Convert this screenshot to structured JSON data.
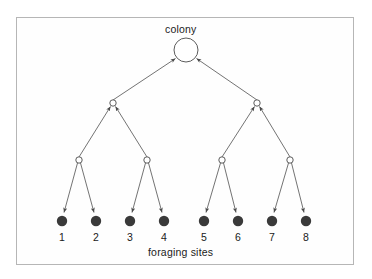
{
  "figure": {
    "title_top": "colony",
    "title_bottom": "foraging sites",
    "frame": {
      "x": 16,
      "y": 17,
      "width": 338,
      "height": 248,
      "border_color": "#b6b6b6"
    },
    "colors": {
      "edge": "#5a5a5a",
      "open_node_stroke": "#4a4a4a",
      "open_node_fill": "#ffffff",
      "leaf_fill": "#3a3a3a",
      "text": "#1a1a1a",
      "background": "#ffffff"
    }
  },
  "diagram": {
    "type": "tree",
    "nodes": [
      {
        "id": "colony",
        "label": "colony",
        "level": 0,
        "x": 186,
        "y": 50,
        "r": 12,
        "style": "open-circle"
      },
      {
        "id": "L1a",
        "label": "",
        "level": 1,
        "x": 113,
        "y": 103,
        "r": 3.2,
        "style": "open-circle"
      },
      {
        "id": "L1b",
        "label": "",
        "level": 1,
        "x": 257,
        "y": 103,
        "r": 3.2,
        "style": "open-circle"
      },
      {
        "id": "L2a",
        "label": "",
        "level": 2,
        "x": 79,
        "y": 160,
        "r": 3.2,
        "style": "open-circle"
      },
      {
        "id": "L2b",
        "label": "",
        "level": 2,
        "x": 147,
        "y": 160,
        "r": 3.2,
        "style": "open-circle"
      },
      {
        "id": "L2c",
        "label": "",
        "level": 2,
        "x": 222,
        "y": 160,
        "r": 3.2,
        "style": "open-circle"
      },
      {
        "id": "L2d",
        "label": "",
        "level": 2,
        "x": 290,
        "y": 160,
        "r": 3.2,
        "style": "open-circle"
      },
      {
        "id": "S1",
        "label": "1",
        "level": 3,
        "x": 62,
        "y": 221,
        "r": 5.2,
        "style": "filled-circle"
      },
      {
        "id": "S2",
        "label": "2",
        "level": 3,
        "x": 96,
        "y": 221,
        "r": 5.2,
        "style": "filled-circle"
      },
      {
        "id": "S3",
        "label": "3",
        "level": 3,
        "x": 130,
        "y": 221,
        "r": 5.2,
        "style": "filled-circle"
      },
      {
        "id": "S4",
        "label": "4",
        "level": 3,
        "x": 164,
        "y": 221,
        "r": 5.2,
        "style": "filled-circle"
      },
      {
        "id": "S5",
        "label": "5",
        "level": 3,
        "x": 204,
        "y": 221,
        "r": 5.2,
        "style": "filled-circle"
      },
      {
        "id": "S6",
        "label": "6",
        "level": 3,
        "x": 238,
        "y": 221,
        "r": 5.2,
        "style": "filled-circle"
      },
      {
        "id": "S7",
        "label": "7",
        "level": 3,
        "x": 272,
        "y": 221,
        "r": 5.2,
        "style": "filled-circle"
      },
      {
        "id": "S8",
        "label": "8",
        "level": 3,
        "x": 306,
        "y": 221,
        "r": 5.2,
        "style": "filled-circle"
      }
    ],
    "edges": [
      {
        "from": "L1a",
        "to": "colony",
        "arrow": "up-into-colony"
      },
      {
        "from": "L1b",
        "to": "colony",
        "arrow": "up-into-colony"
      },
      {
        "from": "L2a",
        "to": "L1a",
        "arrow": "up-into-parent"
      },
      {
        "from": "L2b",
        "to": "L1a",
        "arrow": "up-into-parent"
      },
      {
        "from": "L2c",
        "to": "L1b",
        "arrow": "up-into-parent"
      },
      {
        "from": "L2d",
        "to": "L1b",
        "arrow": "up-into-parent"
      },
      {
        "from": "L2a",
        "to": "S1",
        "arrow": "down-into-leaf"
      },
      {
        "from": "L2a",
        "to": "S2",
        "arrow": "down-into-leaf"
      },
      {
        "from": "L2b",
        "to": "S3",
        "arrow": "down-into-leaf"
      },
      {
        "from": "L2b",
        "to": "S4",
        "arrow": "down-into-leaf"
      },
      {
        "from": "L2c",
        "to": "S5",
        "arrow": "down-into-leaf"
      },
      {
        "from": "L2c",
        "to": "S6",
        "arrow": "down-into-leaf"
      },
      {
        "from": "L2d",
        "to": "S7",
        "arrow": "down-into-leaf"
      },
      {
        "from": "L2d",
        "to": "S8",
        "arrow": "down-into-leaf"
      }
    ],
    "leaf_labels": [
      "1",
      "2",
      "3",
      "4",
      "5",
      "6",
      "7",
      "8"
    ]
  }
}
